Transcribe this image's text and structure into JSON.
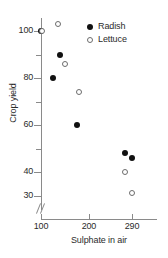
{
  "chart_data": {
    "type": "scatter",
    "title": "",
    "xlabel": "Sulphate in air",
    "ylabel": "Crop yield",
    "xlim": [
      100,
      290
    ],
    "ylim": [
      28,
      108
    ],
    "grid": false,
    "axis_break": "y-axis break below 30",
    "x_ticks": [
      100,
      200,
      290
    ],
    "y_ticks": [
      100,
      80,
      60,
      40,
      30
    ],
    "y_minor_ticks": [
      90,
      70,
      50
    ],
    "legend_position": "top-right",
    "series": [
      {
        "name": "Radish",
        "marker": "filled-circle",
        "color": "#111111",
        "points": [
          {
            "x": 100,
            "y": 100
          },
          {
            "x": 125,
            "y": 80
          },
          {
            "x": 140,
            "y": 90
          },
          {
            "x": 175,
            "y": 60
          },
          {
            "x": 275,
            "y": 48
          },
          {
            "x": 290,
            "y": 46
          }
        ]
      },
      {
        "name": "Lettuce",
        "marker": "open-circle",
        "color": "#6d6d6d",
        "points": [
          {
            "x": 103,
            "y": 100
          },
          {
            "x": 135,
            "y": 103
          },
          {
            "x": 150,
            "y": 86
          },
          {
            "x": 180,
            "y": 74
          },
          {
            "x": 275,
            "y": 40
          },
          {
            "x": 290,
            "y": 31
          }
        ]
      }
    ]
  },
  "axes": {
    "x_tick_labels": [
      "100",
      "200",
      "290"
    ],
    "y_tick_labels": [
      "100",
      "80",
      "60",
      "40",
      "30"
    ],
    "x_title": "Sulphate in air",
    "y_title": "Crop yield"
  },
  "legend": {
    "entries": [
      {
        "label": "Radish",
        "marker": "filled-circle"
      },
      {
        "label": "Lettuce",
        "marker": "open-circle"
      }
    ]
  }
}
